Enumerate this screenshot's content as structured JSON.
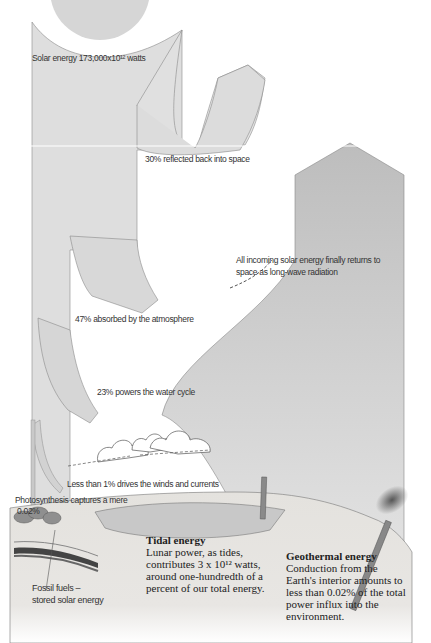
{
  "diagram": {
    "type": "energy-flow"
  },
  "labels": {
    "solar_input": "Solar energy 173,000x10¹² watts",
    "reflected": "30% reflected back into space",
    "returns_line1": "All incoming solar energy finally returns to",
    "returns_line2": "space as long-wave radiation",
    "absorbed": "47% absorbed by the atmosphere",
    "water_cycle": "23% powers the water cycle",
    "winds": "Less than 1% drives the winds and currents",
    "photosynthesis_line1": "Photosynthesis captures a mere",
    "photosynthesis_line2": "0.02%",
    "fossil_line1": "Fossil fuels –",
    "fossil_line2": "stored solar energy"
  },
  "callouts": {
    "tidal": {
      "title": "Tidal energy",
      "body": "Lunar power, as tides,\ncontributes 3 x 10¹² watts,\naround one-hundredth of a\npercent of our total energy."
    },
    "geothermal": {
      "title": "Geothermal energy",
      "body": "Conduction from the\nEarth's interior amounts to\nless than 0.02% of the total\npower influx into the\nenvironment."
    }
  },
  "flows": [
    {
      "name": "solar input",
      "percent": 100
    },
    {
      "name": "reflected",
      "percent": 30
    },
    {
      "name": "absorbed by atmosphere",
      "percent": 47
    },
    {
      "name": "water cycle",
      "percent": 23
    },
    {
      "name": "winds and currents",
      "percent": "<1"
    },
    {
      "name": "photosynthesis",
      "percent": 0.02
    }
  ],
  "colors": {
    "sun": "#d6d6d6",
    "flow": "#dcdcdc",
    "flow_edge": "#8a8a8a",
    "radiation": "#c4c4c4",
    "ground": "#e2e0dc",
    "water": "#bdbdbd"
  }
}
